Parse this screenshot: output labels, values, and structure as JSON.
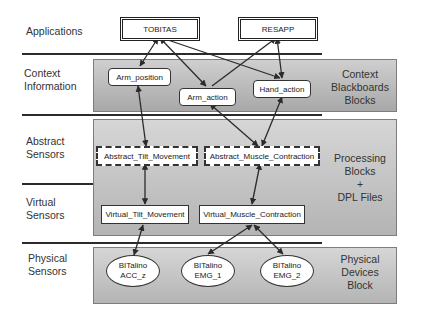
{
  "layers": [
    {
      "id": "applications",
      "label": "Applications"
    },
    {
      "id": "context",
      "label": "Context\nInformation"
    },
    {
      "id": "abstract",
      "label": "Abstract\nSensors"
    },
    {
      "id": "virtual",
      "label": "Virtual\nSensors"
    },
    {
      "id": "physical",
      "label": "Physical\nSensors"
    }
  ],
  "panel_captions": {
    "context": [
      "Context",
      "Blackboards",
      "Blocks"
    ],
    "processing": [
      "Processing",
      "Blocks",
      "+",
      "DPL Files"
    ],
    "physical": [
      "Physical",
      "Devices",
      "Block"
    ]
  },
  "applications": {
    "tobitas": "TOBITAS",
    "resapp": "RESAPP"
  },
  "context_blocks": {
    "arm_position": "Arm_position",
    "arm_action": "Arm_action",
    "hand_action": "Hand_action"
  },
  "abstract_sensors": {
    "tilt": "Abstract_Tilt_Movement",
    "muscle": "Abstract_Muscle_Contraction"
  },
  "virtual_sensors": {
    "tilt": "Virtual_Tilt_Movement",
    "muscle": "Virtual_Muscle_Contraction"
  },
  "physical_devices": [
    {
      "line1": "BITalino",
      "line2": "ACC_z"
    },
    {
      "line1": "BITalino",
      "line2": "EMG_1"
    },
    {
      "line1": "BITalino",
      "line2": "EMG_2"
    }
  ],
  "colors": {
    "line": "#2b2b2b",
    "panel_top": "#cfcfcf",
    "panel_bottom": "#a8a8a8"
  }
}
